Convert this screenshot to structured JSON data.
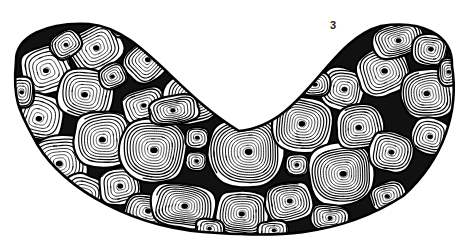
{
  "figure": {
    "label": "3",
    "label_position": {
      "x": 330,
      "y": 20
    },
    "caption_visible": false,
    "background_color": "#ffffff",
    "ink_color": "#000000",
    "canvas": {
      "width": 468,
      "height": 250
    }
  },
  "specimen": {
    "name": "crescent-shaped cross-section",
    "outline_style": "closed reniform / lunate contour, thick black border",
    "outline_stroke_width": 2.6,
    "bounds": {
      "x_min": 13,
      "x_max": 455,
      "y_min": 22,
      "y_max": 232
    },
    "concave_notch": {
      "lowest_y": 131,
      "center_x": 245
    },
    "left_tip": {
      "x": 16,
      "y": 62
    },
    "right_tip": {
      "x": 452,
      "y": 66
    },
    "fill_description": "densely packed polygonal cells, each filled with concentric spiral rings converging on a solid dark nucleus"
  },
  "cells": [
    {
      "cx": 47,
      "cy": 70,
      "rx": 25,
      "ry": 24,
      "rings": 6,
      "rot": -18,
      "nuc": 3.0,
      "sq": 0.3
    },
    {
      "cx": 40,
      "cy": 117,
      "rx": 24,
      "ry": 23,
      "rings": 6,
      "rot": 15,
      "nuc": 3.2,
      "sq": 0.22
    },
    {
      "cx": 59,
      "cy": 163,
      "rx": 29,
      "ry": 27,
      "rings": 8,
      "rot": -8,
      "nuc": 3.4,
      "sq": 0.26
    },
    {
      "cx": 96,
      "cy": 48,
      "rx": 27,
      "ry": 22,
      "rings": 7,
      "rot": -30,
      "nuc": 3.1,
      "sq": 0.34
    },
    {
      "cx": 86,
      "cy": 93,
      "rx": 28,
      "ry": 25,
      "rings": 8,
      "rot": 10,
      "nuc": 3.3,
      "sq": 0.24
    },
    {
      "cx": 104,
      "cy": 139,
      "rx": 30,
      "ry": 28,
      "rings": 9,
      "rot": -5,
      "nuc": 3.4,
      "sq": 0.2
    },
    {
      "cx": 83,
      "cy": 195,
      "rx": 22,
      "ry": 20,
      "rings": 6,
      "rot": 22,
      "nuc": 2.8,
      "sq": 0.28
    },
    {
      "cx": 120,
      "cy": 186,
      "rx": 21,
      "ry": 19,
      "rings": 6,
      "rot": -12,
      "nuc": 2.9,
      "sq": 0.26
    },
    {
      "cx": 148,
      "cy": 60,
      "rx": 24,
      "ry": 20,
      "rings": 7,
      "rot": -42,
      "nuc": 2.9,
      "sq": 0.36
    },
    {
      "cx": 144,
      "cy": 106,
      "rx": 22,
      "ry": 17,
      "rings": 6,
      "rot": -20,
      "nuc": 2.7,
      "sq": 0.32
    },
    {
      "cx": 153,
      "cy": 150,
      "rx": 34,
      "ry": 32,
      "rings": 11,
      "rot": 6,
      "nuc": 3.6,
      "sq": 0.16
    },
    {
      "cx": 147,
      "cy": 212,
      "rx": 23,
      "ry": 18,
      "rings": 7,
      "rot": 12,
      "nuc": 2.9,
      "sq": 0.3
    },
    {
      "cx": 192,
      "cy": 98,
      "rx": 28,
      "ry": 26,
      "rings": 9,
      "rot": -14,
      "nuc": 3.2,
      "sq": 0.22
    },
    {
      "cx": 183,
      "cy": 206,
      "rx": 32,
      "ry": 22,
      "rings": 10,
      "rot": 8,
      "nuc": 3.2,
      "sq": 0.3
    },
    {
      "cx": 197,
      "cy": 138,
      "rx": 12,
      "ry": 11,
      "rings": 4,
      "rot": 0,
      "nuc": 2.4,
      "sq": 0.2
    },
    {
      "cx": 196,
      "cy": 161,
      "rx": 11,
      "ry": 10,
      "rings": 4,
      "rot": 0,
      "nuc": 2.3,
      "sq": 0.18
    },
    {
      "cx": 174,
      "cy": 110,
      "rx": 25,
      "ry": 14,
      "rings": 7,
      "rot": -10,
      "nuc": 2.6,
      "sq": 0.36
    },
    {
      "cx": 246,
      "cy": 152,
      "rx": 38,
      "ry": 36,
      "rings": 13,
      "rot": -4,
      "nuc": 3.8,
      "sq": 0.14
    },
    {
      "cx": 242,
      "cy": 213,
      "rx": 26,
      "ry": 22,
      "rings": 9,
      "rot": 5,
      "nuc": 3.0,
      "sq": 0.32
    },
    {
      "cx": 208,
      "cy": 66,
      "rx": 16,
      "ry": 12,
      "rings": 5,
      "rot": -35,
      "nuc": 2.4,
      "sq": 0.34
    },
    {
      "cx": 289,
      "cy": 202,
      "rx": 24,
      "ry": 20,
      "rings": 8,
      "rot": -10,
      "nuc": 2.9,
      "sq": 0.24
    },
    {
      "cx": 303,
      "cy": 125,
      "rx": 30,
      "ry": 28,
      "rings": 10,
      "rot": 8,
      "nuc": 3.3,
      "sq": 0.2
    },
    {
      "cx": 297,
      "cy": 165,
      "rx": 12,
      "ry": 11,
      "rings": 4,
      "rot": 0,
      "nuc": 2.4,
      "sq": 0.18
    },
    {
      "cx": 341,
      "cy": 174,
      "rx": 33,
      "ry": 31,
      "rings": 12,
      "rot": -6,
      "nuc": 3.5,
      "sq": 0.16
    },
    {
      "cx": 343,
      "cy": 89,
      "rx": 22,
      "ry": 21,
      "rings": 7,
      "rot": 14,
      "nuc": 3.0,
      "sq": 0.22
    },
    {
      "cx": 360,
      "cy": 127,
      "rx": 24,
      "ry": 22,
      "rings": 8,
      "rot": -8,
      "nuc": 3.1,
      "sq": 0.24
    },
    {
      "cx": 383,
      "cy": 72,
      "rx": 26,
      "ry": 24,
      "rings": 8,
      "rot": -20,
      "nuc": 3.2,
      "sq": 0.26
    },
    {
      "cx": 391,
      "cy": 152,
      "rx": 22,
      "ry": 20,
      "rings": 7,
      "rot": 10,
      "nuc": 2.9,
      "sq": 0.22
    },
    {
      "cx": 398,
      "cy": 40,
      "rx": 26,
      "ry": 17,
      "rings": 8,
      "rot": -16,
      "nuc": 2.8,
      "sq": 0.34
    },
    {
      "cx": 430,
      "cy": 50,
      "rx": 18,
      "ry": 16,
      "rings": 6,
      "rot": 8,
      "nuc": 2.7,
      "sq": 0.24
    },
    {
      "cx": 428,
      "cy": 94,
      "rx": 27,
      "ry": 25,
      "rings": 9,
      "rot": -6,
      "nuc": 3.2,
      "sq": 0.2
    },
    {
      "cx": 430,
      "cy": 136,
      "rx": 19,
      "ry": 18,
      "rings": 6,
      "rot": 12,
      "nuc": 2.7,
      "sq": 0.22
    },
    {
      "cx": 315,
      "cy": 84,
      "rx": 15,
      "ry": 13,
      "rings": 5,
      "rot": 0,
      "nuc": 2.5,
      "sq": 0.2
    },
    {
      "cx": 388,
      "cy": 196,
      "rx": 18,
      "ry": 14,
      "rings": 6,
      "rot": -18,
      "nuc": 2.6,
      "sq": 0.3
    },
    {
      "cx": 330,
      "cy": 218,
      "rx": 20,
      "ry": 13,
      "rings": 6,
      "rot": 6,
      "nuc": 2.5,
      "sq": 0.32
    },
    {
      "cx": 60,
      "cy": 203,
      "rx": 14,
      "ry": 10,
      "rings": 5,
      "rot": 26,
      "nuc": 2.3,
      "sq": 0.34
    },
    {
      "cx": 113,
      "cy": 76,
      "rx": 14,
      "ry": 12,
      "rings": 5,
      "rot": -24,
      "nuc": 2.4,
      "sq": 0.26
    },
    {
      "cx": 66,
      "cy": 44,
      "rx": 16,
      "ry": 13,
      "rings": 5,
      "rot": -34,
      "nuc": 2.4,
      "sq": 0.3
    },
    {
      "cx": 210,
      "cy": 228,
      "rx": 14,
      "ry": 9,
      "rings": 4,
      "rot": 4,
      "nuc": 2.2,
      "sq": 0.34
    },
    {
      "cx": 273,
      "cy": 230,
      "rx": 15,
      "ry": 9,
      "rings": 4,
      "rot": -4,
      "nuc": 2.2,
      "sq": 0.34
    },
    {
      "cx": 449,
      "cy": 72,
      "rx": 11,
      "ry": 14,
      "rings": 5,
      "rot": 0,
      "nuc": 2.3,
      "sq": 0.22
    },
    {
      "cx": 22,
      "cy": 92,
      "rx": 12,
      "ry": 16,
      "rings": 5,
      "rot": 0,
      "nuc": 2.3,
      "sq": 0.22
    },
    {
      "cx": 126,
      "cy": 24,
      "rx": 16,
      "ry": 10,
      "rings": 4,
      "rot": -28,
      "nuc": 2.2,
      "sq": 0.34
    }
  ],
  "render": {
    "ring_stroke_min": 0.55,
    "ring_stroke_max": 1.35,
    "cell_border_stroke": 2.2,
    "spiral_turn_samples": 260
  }
}
